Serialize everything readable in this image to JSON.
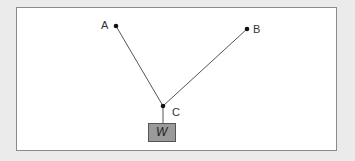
{
  "diagram": {
    "points": {
      "A": {
        "label": "A",
        "x": 116,
        "y": 26
      },
      "B": {
        "label": "B",
        "x": 247,
        "y": 29
      },
      "C": {
        "label": "C",
        "x": 163,
        "y": 106
      }
    },
    "weight": {
      "label": "W",
      "fill": "#9a9a9a"
    },
    "edges": [
      [
        "A",
        "C"
      ],
      [
        "B",
        "C"
      ],
      [
        "C",
        "W"
      ]
    ]
  }
}
